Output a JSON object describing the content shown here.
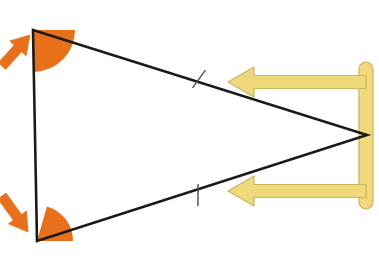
{
  "figure": {
    "background_color": "#ffffff",
    "width": 379,
    "height": 268
  },
  "colors": {
    "stroke": "#1a1a1a",
    "angle_fill": "#e8701a",
    "angle_arrow": "#e8701a",
    "side_marker": "#efd97a",
    "side_marker_outline": "#c9b45e",
    "tick": "#55555a",
    "background": "#ffffff"
  },
  "triangle": {
    "name": "isosceles-triangle",
    "vertices": {
      "top_left": {
        "label": "A",
        "x": 33,
        "y": 30
      },
      "bottom_left": {
        "label": "B",
        "x": 37,
        "y": 241
      },
      "right": {
        "label": "C",
        "x": 367,
        "y": 135
      }
    },
    "stroke_width": 2.6,
    "fill": "none"
  },
  "angle_markers": [
    {
      "name": "angle-marker-top",
      "at_vertex": "top_left",
      "center_x": 33,
      "center_y": 30,
      "radius": 42,
      "start_angle_deg": 0,
      "end_angle_deg": 89,
      "fill": "#e8701a"
    },
    {
      "name": "angle-marker-bottom",
      "at_vertex": "bottom_left",
      "center_x": 37,
      "center_y": 241,
      "radius": 36,
      "start_angle_deg": -74,
      "end_angle_deg": 0,
      "fill": "#e8701a"
    }
  ],
  "angle_pointers": [
    {
      "name": "angle-pointer-top",
      "direction": "up-right",
      "tail_x": 2,
      "tail_y": 66,
      "tip_x": 30,
      "tip_y": 35,
      "color": "#e8701a"
    },
    {
      "name": "angle-pointer-bottom",
      "direction": "down-right",
      "tail_x": 2,
      "tail_y": 196,
      "tip_x": 28,
      "tip_y": 232,
      "color": "#e8701a"
    }
  ],
  "side_ticks": [
    {
      "name": "side-tick-upper",
      "on_side": "top_left-to-right",
      "x": 199,
      "y": 79,
      "length": 22,
      "count": 1
    },
    {
      "name": "side-tick-lower",
      "on_side": "bottom_left-to-right",
      "x": 198,
      "y": 195,
      "length": 22,
      "count": 1
    }
  ],
  "side_bracket": {
    "name": "congruent-sides-bracket",
    "description": "Yellow bracket with two left-pointing arrowheads indicating the two congruent sides",
    "spine_x": 366,
    "spine_top_y": 62,
    "spine_bottom_y": 209,
    "spine_width": 14,
    "arms": [
      {
        "name": "bracket-arm-upper",
        "y": 82,
        "from_x": 366,
        "to_x": 228,
        "thickness": 13,
        "arrowhead": "left"
      },
      {
        "name": "bracket-arm-lower",
        "y": 191,
        "from_x": 366,
        "to_x": 228,
        "thickness": 13,
        "arrowhead": "left"
      }
    ],
    "fill": "#efd97a",
    "outline": "#c9b45e"
  }
}
